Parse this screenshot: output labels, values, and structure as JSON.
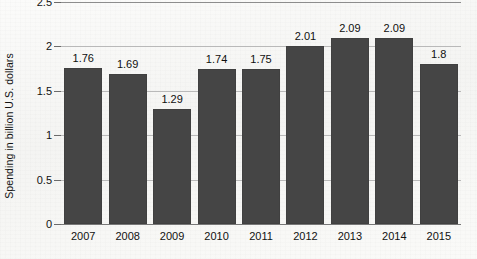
{
  "chart_data": {
    "type": "bar",
    "title": "",
    "xlabel": "",
    "ylabel": "Spending in billion U.S. dollars",
    "categories": [
      "2007",
      "2008",
      "2009",
      "2010",
      "2011",
      "2012",
      "2013",
      "2014",
      "2015"
    ],
    "values": [
      1.76,
      1.69,
      1.29,
      1.74,
      1.75,
      2.01,
      2.09,
      2.09,
      1.8
    ],
    "value_labels": [
      "1.76",
      "1.69",
      "1.29",
      "1.74",
      "1.75",
      "2.01",
      "2.09",
      "2.09",
      "1.8"
    ],
    "ylim": [
      0,
      2.5
    ],
    "ytick_values": [
      0,
      0.5,
      1,
      1.5,
      2,
      2.5
    ],
    "ytick_labels": [
      "0",
      "0.5",
      "1",
      "1.5",
      "2",
      "2.5"
    ],
    "grid": true,
    "legend": "none",
    "bar_color": "#454545",
    "gridline_color": "#b9b9b9",
    "background_color": "#f7f7f5",
    "text_color": "#111111"
  }
}
